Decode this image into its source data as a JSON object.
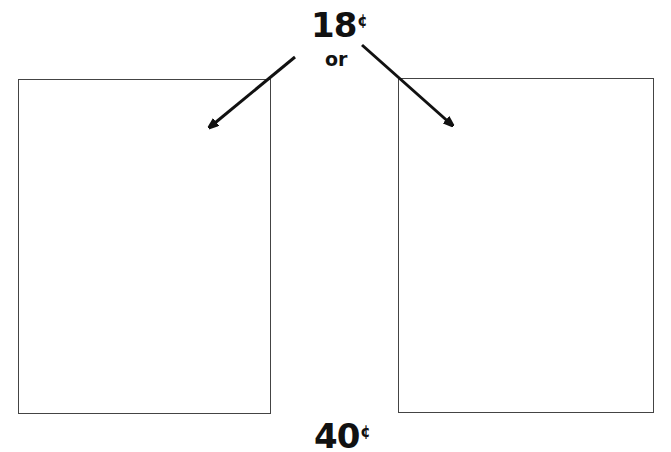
{
  "top_price": {
    "value": "18",
    "unit": "¢"
  },
  "connector": "or",
  "bottom_price": {
    "value": "40",
    "unit": "¢"
  },
  "boxes": [
    {
      "id": "left",
      "content": ""
    },
    {
      "id": "right",
      "content": ""
    }
  ],
  "arrows": [
    {
      "from": [
        295,
        57
      ],
      "to": [
        204,
        132
      ]
    },
    {
      "from": [
        362,
        45
      ],
      "to": [
        458,
        130
      ]
    }
  ],
  "colors": {
    "line": "#444444",
    "text": "#111111",
    "background": "#ffffff"
  }
}
